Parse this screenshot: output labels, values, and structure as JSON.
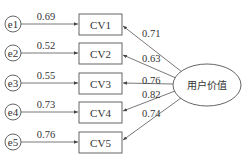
{
  "diagram": {
    "latent": {
      "label": "用户价值"
    },
    "errors": [
      {
        "label": "e1",
        "weight": "0.69"
      },
      {
        "label": "e2",
        "weight": "0.52"
      },
      {
        "label": "e3",
        "weight": "0.55"
      },
      {
        "label": "e4",
        "weight": "0.73"
      },
      {
        "label": "e5",
        "weight": "0.76"
      }
    ],
    "indicators": [
      {
        "label": "CV1",
        "loading": "0.71"
      },
      {
        "label": "CV2",
        "loading": "0.63"
      },
      {
        "label": "CV3",
        "loading": "0.76"
      },
      {
        "label": "CV4",
        "loading": "0.82"
      },
      {
        "label": "CV5",
        "loading": "0.74"
      }
    ]
  }
}
